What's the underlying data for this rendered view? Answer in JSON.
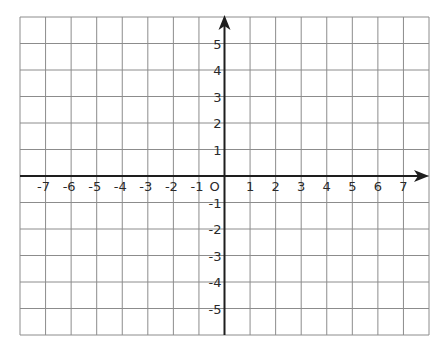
{
  "diagram": {
    "type": "coordinate-plane",
    "grid": {
      "left": 20,
      "top": 17,
      "right": 429,
      "bottom": 335,
      "columns": 16,
      "rows": 12,
      "line_color": "#8c8c8c",
      "axis_color": "#1e1e1e",
      "background": "#ffffff"
    },
    "x_axis": {
      "min": -8,
      "max": 8,
      "ticks": [
        "-7",
        "-6",
        "-5",
        "-4",
        "-3",
        "-2",
        "-1",
        "1",
        "2",
        "3",
        "4",
        "5",
        "6",
        "7"
      ],
      "tick_values": [
        -7,
        -6,
        -5,
        -4,
        -3,
        -2,
        -1,
        1,
        2,
        3,
        4,
        5,
        6,
        7
      ],
      "arrow": "right"
    },
    "y_axis": {
      "min": -6,
      "max": 6,
      "ticks": [
        "5",
        "4",
        "3",
        "2",
        "1",
        "-1",
        "-2",
        "-3",
        "-4",
        "-5"
      ],
      "tick_values": [
        5,
        4,
        3,
        2,
        1,
        -1,
        -2,
        -3,
        -4,
        -5
      ],
      "arrow": "up"
    },
    "origin_label": "O"
  }
}
